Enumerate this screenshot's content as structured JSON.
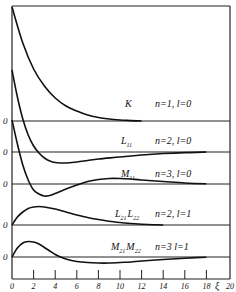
{
  "chart_data": {
    "type": "line",
    "title": "",
    "xlabel": "ξ",
    "ylabel": "",
    "xlim": [
      0,
      20
    ],
    "x_ticks": [
      0,
      2,
      4,
      6,
      8,
      10,
      12,
      14,
      16,
      18,
      20
    ],
    "x_tick_labels": [
      "0",
      "2",
      "4",
      "6",
      "8",
      "10",
      "12",
      "14",
      "16",
      "18",
      "20"
    ],
    "grid": false,
    "legend": "inline labels to the right of each curve",
    "zero_label": "0",
    "series": [
      {
        "name": "K",
        "label": "K",
        "quantum": "n=1, l=0",
        "baseline_px": 121,
        "points": [
          [
            0,
            114
          ],
          [
            1,
            78
          ],
          [
            2,
            52
          ],
          [
            3,
            35
          ],
          [
            4,
            23
          ],
          [
            5,
            15
          ],
          [
            6,
            10
          ],
          [
            7,
            6
          ],
          [
            8,
            3.5
          ],
          [
            9,
            2
          ],
          [
            10,
            1
          ],
          [
            11,
            0.4
          ],
          [
            12,
            0
          ]
        ]
      },
      {
        "name": "L11",
        "label": "L₁₁",
        "quantum": "n=2, l=0",
        "baseline_px": 152,
        "points": [
          [
            0,
            82
          ],
          [
            0.5,
            55
          ],
          [
            1,
            33
          ],
          [
            1.5,
            17
          ],
          [
            2,
            6
          ],
          [
            2.5,
            -1
          ],
          [
            3,
            -6
          ],
          [
            3.5,
            -9
          ],
          [
            4,
            -10.5
          ],
          [
            5,
            -11
          ],
          [
            6,
            -10
          ],
          [
            7,
            -8.5
          ],
          [
            8,
            -7
          ],
          [
            10,
            -5
          ],
          [
            12,
            -3
          ],
          [
            14,
            -1.5
          ],
          [
            16,
            -0.6
          ],
          [
            18,
            0
          ]
        ]
      },
      {
        "name": "M11",
        "label": "M₁₁",
        "quantum": "n=3, l=0",
        "baseline_px": 184,
        "points": [
          [
            0,
            64
          ],
          [
            0.5,
            40
          ],
          [
            1,
            19
          ],
          [
            1.5,
            4
          ],
          [
            2,
            -6
          ],
          [
            2.5,
            -10
          ],
          [
            3,
            -12
          ],
          [
            3.5,
            -11.5
          ],
          [
            4,
            -9.5
          ],
          [
            5,
            -5
          ],
          [
            6,
            -1
          ],
          [
            7,
            2.5
          ],
          [
            8,
            4.5
          ],
          [
            9,
            5.5
          ],
          [
            10,
            5.5
          ],
          [
            11,
            5
          ],
          [
            12,
            4
          ],
          [
            14,
            2.5
          ],
          [
            16,
            1
          ],
          [
            18,
            0.2
          ]
        ]
      },
      {
        "name": "L21_L22",
        "label": "L₂₁ L₂₂",
        "quantum": "n=2, l=1",
        "baseline_px": 225,
        "points": [
          [
            0,
            0
          ],
          [
            0.5,
            8
          ],
          [
            1,
            13
          ],
          [
            1.5,
            16.5
          ],
          [
            2,
            18
          ],
          [
            2.5,
            18.5
          ],
          [
            3,
            18
          ],
          [
            4,
            16
          ],
          [
            5,
            13
          ],
          [
            6,
            10
          ],
          [
            7,
            7.5
          ],
          [
            8,
            5.5
          ],
          [
            9,
            3.8
          ],
          [
            10,
            2.5
          ],
          [
            11,
            1.5
          ],
          [
            12,
            0.8
          ],
          [
            13,
            0.3
          ],
          [
            14,
            0
          ]
        ]
      },
      {
        "name": "M21_M22",
        "label": "M₂₁ M₂₂",
        "quantum": "n=3 l=1",
        "baseline_px": 257,
        "points": [
          [
            0,
            0
          ],
          [
            0.5,
            9
          ],
          [
            1,
            14
          ],
          [
            1.5,
            15.5
          ],
          [
            2,
            15
          ],
          [
            2.5,
            13
          ],
          [
            3,
            9.5
          ],
          [
            3.5,
            6
          ],
          [
            4,
            2.5
          ],
          [
            4.5,
            0
          ],
          [
            5,
            -2
          ],
          [
            6,
            -4.5
          ],
          [
            7,
            -5.5
          ],
          [
            8,
            -6
          ],
          [
            9,
            -6
          ],
          [
            10,
            -5.5
          ],
          [
            11,
            -5
          ],
          [
            12,
            -4
          ],
          [
            14,
            -2.5
          ],
          [
            16,
            -1.2
          ],
          [
            18,
            -0.3
          ]
        ]
      }
    ]
  },
  "labels": {
    "K": "K",
    "K_q": "n=1,  l=0",
    "L11": "L",
    "L11_sub": "11",
    "L11_q": "n=2,  l=0",
    "M11": "M",
    "M11_sub": "11",
    "M11_q": "n=3,  l=0",
    "L21": "L",
    "L21_sub": "21",
    "L22": "L",
    "L22_sub": "22",
    "L2x_q": "n=2,  l=1",
    "M21": "M",
    "M21_sub": "21",
    "M22": "M",
    "M22_sub": "22",
    "M2x_q": "n=3   l=1",
    "zero": "0",
    "xi": "ξ"
  }
}
